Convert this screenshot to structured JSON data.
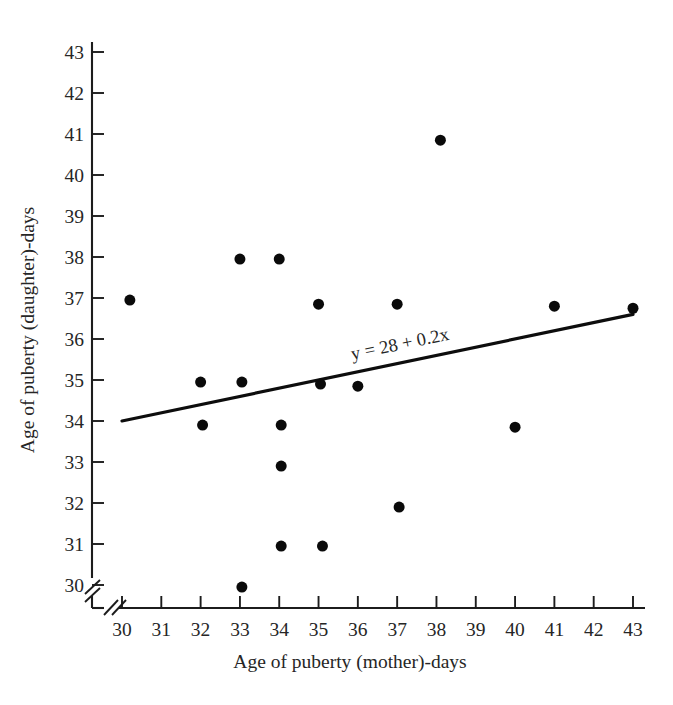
{
  "chart_data": {
    "type": "scatter",
    "title": "",
    "xlabel": "Age of puberty (mother)-days",
    "ylabel": "Age of puberty (daughter)-days",
    "xlim": [
      30,
      43
    ],
    "ylim": [
      30,
      43
    ],
    "xticks": [
      30,
      31,
      32,
      33,
      34,
      35,
      36,
      37,
      38,
      39,
      40,
      41,
      42,
      43
    ],
    "yticks": [
      30,
      31,
      32,
      33,
      34,
      35,
      36,
      37,
      38,
      39,
      40,
      41,
      42,
      43
    ],
    "xtick_labels": [
      "30",
      "31",
      "32",
      "33",
      "34",
      "35",
      "36",
      "37",
      "38",
      "39",
      "40",
      "41",
      "42",
      "43"
    ],
    "ytick_labels": [
      "30",
      "31",
      "32",
      "33",
      "34",
      "35",
      "36",
      "37",
      "38",
      "39",
      "40",
      "41",
      "42",
      "43"
    ],
    "grid": false,
    "legend": null,
    "axis_break_x": true,
    "axis_break_y": true,
    "marker": "filled-circle",
    "marker_color": "#0a0a0a",
    "marker_size_px": 11,
    "points": [
      {
        "x": 30.2,
        "y": 36.95
      },
      {
        "x": 32.0,
        "y": 34.95
      },
      {
        "x": 32.05,
        "y": 33.9
      },
      {
        "x": 33.0,
        "y": 37.95
      },
      {
        "x": 33.05,
        "y": 34.95
      },
      {
        "x": 33.05,
        "y": 29.95
      },
      {
        "x": 34.0,
        "y": 37.95
      },
      {
        "x": 34.05,
        "y": 33.9
      },
      {
        "x": 34.05,
        "y": 32.9
      },
      {
        "x": 34.05,
        "y": 30.95
      },
      {
        "x": 35.0,
        "y": 36.85
      },
      {
        "x": 35.05,
        "y": 34.9
      },
      {
        "x": 35.1,
        "y": 30.95
      },
      {
        "x": 36.0,
        "y": 34.85
      },
      {
        "x": 37.0,
        "y": 36.85
      },
      {
        "x": 37.05,
        "y": 31.9
      },
      {
        "x": 38.1,
        "y": 40.85
      },
      {
        "x": 40.0,
        "y": 33.85
      },
      {
        "x": 41.0,
        "y": 36.8
      },
      {
        "x": 43.0,
        "y": 36.75
      }
    ],
    "fit_line": {
      "equation_label": "y = 28 + 0.2x",
      "intercept": 28,
      "slope": 0.2,
      "x_start": 30,
      "y_start": 34.0,
      "x_end": 43,
      "y_end": 36.6,
      "color": "#0d0d0d"
    }
  }
}
